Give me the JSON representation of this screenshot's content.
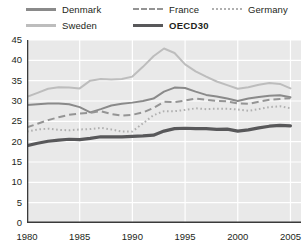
{
  "chart_data": {
    "type": "line",
    "title": "",
    "xlabel": "",
    "ylabel": "",
    "xlim": [
      1980,
      2006
    ],
    "ylim": [
      0,
      45
    ],
    "ytick_step": 5,
    "yticks": [
      0,
      5,
      10,
      15,
      20,
      25,
      30,
      35,
      40,
      45
    ],
    "xticks": [
      1980,
      1985,
      1990,
      1995,
      2000,
      2005
    ],
    "grid": true,
    "grid_color": "#ffffff",
    "plot_background": "#e9e9e9",
    "legend_position": "top",
    "x": [
      1980,
      1981,
      1982,
      1983,
      1984,
      1985,
      1986,
      1987,
      1988,
      1989,
      1990,
      1991,
      1992,
      1993,
      1994,
      1995,
      1996,
      1997,
      1998,
      1999,
      2000,
      2001,
      2002,
      2003,
      2004,
      2005
    ],
    "series": [
      {
        "name": "Denmark",
        "style": "solid",
        "color": "#8a8a8a",
        "width": 2.0,
        "values": [
          29.0,
          29.2,
          29.4,
          29.4,
          29.2,
          28.5,
          27.2,
          28.0,
          28.9,
          29.3,
          29.6,
          30.0,
          30.6,
          32.3,
          33.3,
          33.2,
          32.3,
          31.5,
          31.1,
          30.6,
          30.0,
          30.6,
          31.0,
          31.3,
          31.4,
          30.9
        ]
      },
      {
        "name": "Sweden",
        "style": "solid",
        "color": "#bdbdbd",
        "width": 2.0,
        "values": [
          31.0,
          32.0,
          33.0,
          33.4,
          33.3,
          33.1,
          35.0,
          35.4,
          35.3,
          35.4,
          36.0,
          38.4,
          41.0,
          42.9,
          41.8,
          39.0,
          37.3,
          36.0,
          34.8,
          33.9,
          33.0,
          33.4,
          34.0,
          34.4,
          34.2,
          33.1
        ]
      },
      {
        "name": "France",
        "style": "dashed",
        "color": "#949494",
        "width": 2.0,
        "values": [
          23.5,
          24.4,
          25.3,
          26.0,
          26.6,
          26.9,
          27.1,
          27.5,
          26.8,
          26.4,
          26.6,
          27.2,
          28.3,
          29.8,
          29.7,
          30.1,
          30.6,
          30.3,
          30.0,
          29.9,
          29.4,
          29.3,
          29.8,
          30.3,
          30.5,
          30.7
        ]
      },
      {
        "name": "Germany",
        "style": "dotted",
        "color": "#b0b0b0",
        "width": 2.0,
        "values": [
          22.5,
          23.0,
          23.2,
          22.9,
          22.8,
          23.0,
          23.1,
          23.4,
          23.0,
          22.5,
          22.5,
          24.5,
          26.5,
          27.5,
          27.5,
          27.8,
          28.2,
          28.0,
          28.1,
          28.1,
          27.9,
          27.6,
          28.0,
          28.5,
          28.7,
          28.2
        ]
      },
      {
        "name": "OECD30",
        "style": "solid-thick",
        "color": "#58585a",
        "width": 3.2,
        "values": [
          19.0,
          19.6,
          20.1,
          20.4,
          20.6,
          20.5,
          20.8,
          21.2,
          21.2,
          21.2,
          21.3,
          21.4,
          21.6,
          22.6,
          23.2,
          23.3,
          23.2,
          23.2,
          23.0,
          23.1,
          22.6,
          22.9,
          23.4,
          23.8,
          24.0,
          23.9
        ]
      }
    ]
  },
  "legend": {
    "items": [
      {
        "label": "Denmark"
      },
      {
        "label": "France"
      },
      {
        "label": "Germany"
      },
      {
        "label": "Sweden"
      },
      {
        "label": "OECD30"
      }
    ]
  },
  "axes": {
    "ylabels": [
      "45",
      "40",
      "35",
      "30",
      "25",
      "20",
      "15",
      "10",
      "5",
      "0"
    ],
    "xlabels": [
      "1980",
      "1985",
      "1990",
      "1995",
      "2000",
      "2005"
    ]
  }
}
